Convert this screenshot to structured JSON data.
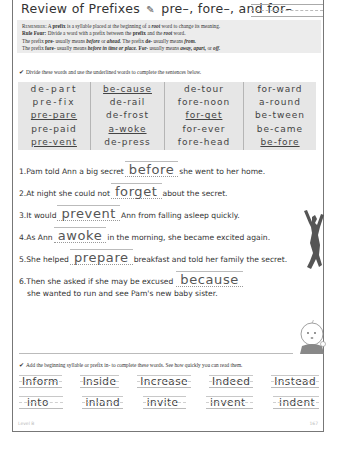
{
  "header": {
    "title_prefix": "Review of Prefixes",
    "pencil_icon": "✎",
    "title_suffix": "pre–, fore–, and for–"
  },
  "rules": {
    "line1": {
      "label": "Remember:",
      "pre": " A ",
      "prefix": "prefix",
      "mid": " is a syllable placed at the beginning of a ",
      "root": "root",
      "post": " word to change its meaning."
    },
    "line2": {
      "label": "Rule Four:",
      "pre": " Divide a word with a prefix between the ",
      "prefix": "prefix",
      "mid": " and the ",
      "root": "root",
      "post": " word."
    },
    "line3": {
      "a": "The prefix ",
      "b": "pre-",
      "c": " usually means ",
      "d": "before",
      "e": " or ",
      "f": "ahead.",
      "g": " The prefix ",
      "h": "de-",
      "i": " usually means ",
      "j": "from."
    },
    "line4": {
      "a": "The prefix ",
      "b": "fore-",
      "c": " usually means ",
      "d": "before in time or place.",
      "e": " For-",
      "f": " usually means ",
      "g": "away, apart,",
      "h": " or ",
      "i": "off."
    }
  },
  "instructions": {
    "check_icon": "✔",
    "divide": "Divide these words and use the underlined words to complete the sentences below.",
    "add_prefix": "Add the beginning syllable or prefix in- to complete these words. See how quickly you can read them."
  },
  "word_table": {
    "columns": [
      [
        {
          "text": "de-part",
          "underlined": false
        },
        {
          "text": "pre-fix",
          "underlined": false
        },
        {
          "text": "pre-pare",
          "underlined": true
        },
        {
          "text": "pre-paid",
          "underlined": false
        },
        {
          "text": "pre-vent",
          "underlined": true
        }
      ],
      [
        {
          "text": "be-cause",
          "underlined": true
        },
        {
          "text": "de-rail",
          "underlined": false
        },
        {
          "text": "de-frost",
          "underlined": false
        },
        {
          "text": "a-woke",
          "underlined": true
        },
        {
          "text": "de-press",
          "underlined": false
        }
      ],
      [
        {
          "text": "de-tour",
          "underlined": false
        },
        {
          "text": "fore-noon",
          "underlined": false
        },
        {
          "text": "for-get",
          "underlined": true
        },
        {
          "text": "for-ever",
          "underlined": false
        },
        {
          "text": "fore-head",
          "underlined": false
        }
      ],
      [
        {
          "text": "for-ward",
          "underlined": false
        },
        {
          "text": "a-round",
          "underlined": false
        },
        {
          "text": "be-tween",
          "underlined": false
        },
        {
          "text": "be-came",
          "underlined": false
        },
        {
          "text": "be-fore",
          "underlined": true
        }
      ]
    ]
  },
  "sentences": [
    {
      "num": "1.",
      "before": " Pam told Ann a big secret",
      "answer": "before",
      "after": "she went to her home."
    },
    {
      "num": "2.",
      "before": " At night she could not",
      "answer": "forget",
      "after": "about the secret."
    },
    {
      "num": "3.",
      "before": " It would",
      "answer": "prevent",
      "after": "Ann from falling asleep quickly."
    },
    {
      "num": "4.",
      "before": " As Ann",
      "answer": "awoke",
      "after": "in the morning, she became excited again."
    },
    {
      "num": "5.",
      "before": " She helped",
      "answer": "prepare",
      "after": "breakfast and told her family the secret."
    },
    {
      "num": "6.",
      "before": " Then she asked if she may be excused",
      "answer": "because",
      "after": "",
      "continuation": "she wanted to run and see Pam's new baby sister."
    }
  ],
  "in_words": [
    [
      "Inform",
      "Inside",
      "Increase",
      "Indeed",
      "Instead"
    ],
    [
      "into",
      "inland",
      "invite",
      "invent",
      "indent"
    ]
  ],
  "footer": {
    "level": "Level B",
    "page": "167"
  }
}
